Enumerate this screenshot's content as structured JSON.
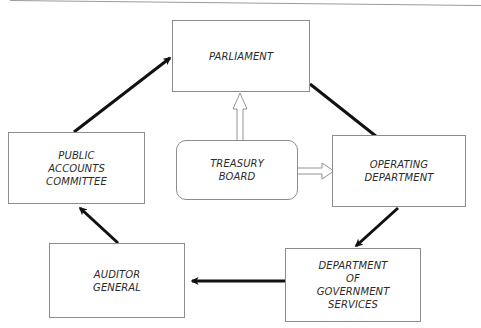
{
  "header": {
    "text": "…"
  },
  "nodes": {
    "parliament": {
      "label": "PARLIAMENT"
    },
    "treasury_board": {
      "label": "TREASURY\nBOARD"
    },
    "operating_department": {
      "label": "OPERATING\nDEPARTMENT"
    },
    "government_services": {
      "label": "DEPARTMENT\nOF\nGOVERNMENT\nSERVICES"
    },
    "auditor_general": {
      "label": "AUDITOR\nGENERAL"
    },
    "public_accounts_committee": {
      "label": "PUBLIC\nACCOUNTS\nCOMMITTEE"
    }
  },
  "edges": [
    {
      "from": "parliament",
      "to": "operating_department",
      "style": "solid"
    },
    {
      "from": "operating_department",
      "to": "government_services",
      "style": "solid"
    },
    {
      "from": "government_services",
      "to": "auditor_general",
      "style": "solid"
    },
    {
      "from": "auditor_general",
      "to": "public_accounts_committee",
      "style": "solid"
    },
    {
      "from": "public_accounts_committee",
      "to": "parliament",
      "style": "solid"
    },
    {
      "from": "treasury_board",
      "to": "parliament",
      "style": "hollow"
    },
    {
      "from": "treasury_board",
      "to": "operating_department",
      "style": "hollow"
    }
  ],
  "colors": {
    "line": "#111111",
    "border": "#8c8c8c",
    "text": "#2a2a2a"
  }
}
